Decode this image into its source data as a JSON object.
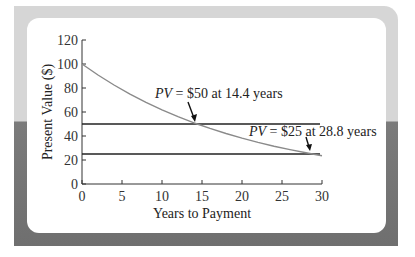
{
  "chart_data": {
    "type": "line",
    "title": "",
    "xlabel": "Years to Payment",
    "ylabel": "Present Value ($)",
    "xlim": [
      0,
      30
    ],
    "ylim": [
      0,
      120
    ],
    "x_ticks": [
      "0",
      "5",
      "10",
      "15",
      "20",
      "25",
      "30"
    ],
    "y_ticks": [
      "0",
      "20",
      "40",
      "60",
      "80",
      "100",
      "120"
    ],
    "grid": false,
    "series": [
      {
        "name": "Present Value",
        "color": "#8a8a8a",
        "x": [
          0,
          2,
          4,
          6,
          8,
          10,
          12,
          14,
          14.4,
          16,
          18,
          20,
          22,
          24,
          26,
          28,
          28.8,
          30
        ],
        "values": [
          100,
          90.8,
          82.5,
          74.9,
          68.1,
          61.8,
          56.2,
          51.0,
          50,
          46.3,
          42.1,
          38.2,
          34.7,
          31.5,
          28.7,
          26.0,
          25,
          23.6
        ]
      },
      {
        "name": "PV = $50 line",
        "color": "#222222",
        "x": [
          0,
          30
        ],
        "values": [
          50,
          50
        ]
      },
      {
        "name": "PV = $25 line",
        "color": "#222222",
        "x": [
          0,
          30
        ],
        "values": [
          25,
          25
        ]
      }
    ],
    "annotations": [
      {
        "text_italic": "PV",
        "text": " = $50 at 14.4 years",
        "x": 14.4,
        "y": 50
      },
      {
        "text_italic": "PV",
        "text": " = $25 at 28.8 years",
        "x": 28.8,
        "y": 25
      }
    ]
  },
  "labels": {
    "xlabel": "Years to Payment",
    "ylabel": "Present Value ($)",
    "ann1_italic": "PV",
    "ann1_rest": " = $50 at 14.4 years",
    "ann2_italic": "PV",
    "ann2_rest": " = $25 at 28.8 years",
    "x_ticks": [
      "0",
      "5",
      "10",
      "15",
      "20",
      "25",
      "30"
    ],
    "y_ticks": [
      "0",
      "20",
      "40",
      "60",
      "80",
      "100",
      "120"
    ]
  }
}
